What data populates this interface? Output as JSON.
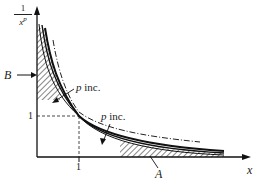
{
  "figure": {
    "y_axis_label_numerator": "1",
    "y_axis_label_denominator": "x",
    "y_axis_label_exponent": "p",
    "x_axis_label": "x",
    "x_tick_label": "1",
    "y_tick_label": "1",
    "label_B": "B",
    "label_A": "A",
    "annotation_upper": "p inc.",
    "annotation_lower": "p inc.",
    "annotation_var": "p",
    "annotation_text": " inc.",
    "colors": {
      "ink": "#1a1a1a",
      "background": "#ffffff"
    }
  }
}
